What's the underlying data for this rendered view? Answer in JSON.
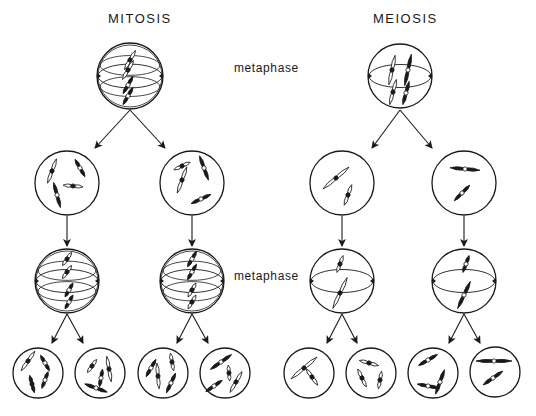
{
  "figure": {
    "background": "#ffffff",
    "ink": "#1a1a1a",
    "titles": {
      "mitosis": {
        "text": "MITOSIS",
        "x": 108,
        "y": 18
      },
      "meiosis": {
        "text": "MEIOSIS",
        "x": 373,
        "y": 18
      }
    },
    "phase_labels": [
      {
        "text": "metaphase",
        "x": 234,
        "y": 68
      },
      {
        "text": "metaphase",
        "x": 234,
        "y": 276
      }
    ],
    "cells": [
      {
        "id": "mitosis-parent",
        "cx": 130,
        "cy": 76,
        "r": 33,
        "spindle": true,
        "group": "mitosis",
        "stage": "metaphase"
      },
      {
        "id": "mitosis-daughter-a",
        "cx": 67,
        "cy": 183,
        "r": 32,
        "spindle": false,
        "group": "mitosis"
      },
      {
        "id": "mitosis-daughter-b",
        "cx": 192,
        "cy": 183,
        "r": 32,
        "spindle": false,
        "group": "mitosis"
      },
      {
        "id": "mitosis-daughter-a-metaphase",
        "cx": 67,
        "cy": 281,
        "r": 32,
        "spindle": true,
        "group": "mitosis",
        "stage": "metaphase"
      },
      {
        "id": "mitosis-daughter-b-metaphase",
        "cx": 192,
        "cy": 281,
        "r": 32,
        "spindle": true,
        "group": "mitosis",
        "stage": "metaphase"
      },
      {
        "id": "mitosis-grand-1",
        "cx": 38,
        "cy": 373,
        "r": 25,
        "spindle": false,
        "group": "mitosis"
      },
      {
        "id": "mitosis-grand-2",
        "cx": 100,
        "cy": 373,
        "r": 25,
        "spindle": false,
        "group": "mitosis"
      },
      {
        "id": "mitosis-grand-3",
        "cx": 163,
        "cy": 373,
        "r": 25,
        "spindle": false,
        "group": "mitosis"
      },
      {
        "id": "mitosis-grand-4",
        "cx": 225,
        "cy": 373,
        "r": 25,
        "spindle": false,
        "group": "mitosis"
      },
      {
        "id": "meiosis-parent",
        "cx": 400,
        "cy": 76,
        "r": 32,
        "spindle": true,
        "group": "meiosis",
        "stage": "metaphase"
      },
      {
        "id": "meiosis-daughter-a",
        "cx": 342,
        "cy": 183,
        "r": 32,
        "spindle": false,
        "group": "meiosis"
      },
      {
        "id": "meiosis-daughter-b",
        "cx": 464,
        "cy": 183,
        "r": 32,
        "spindle": false,
        "group": "meiosis"
      },
      {
        "id": "meiosis-daughter-a-metaphase",
        "cx": 342,
        "cy": 281,
        "r": 32,
        "spindle": true,
        "group": "meiosis",
        "stage": "metaphase"
      },
      {
        "id": "meiosis-daughter-b-metaphase",
        "cx": 464,
        "cy": 281,
        "r": 32,
        "spindle": true,
        "group": "meiosis",
        "stage": "metaphase"
      },
      {
        "id": "meiosis-grand-1",
        "cx": 309,
        "cy": 373,
        "r": 25,
        "spindle": false,
        "group": "meiosis"
      },
      {
        "id": "meiosis-grand-2",
        "cx": 371,
        "cy": 373,
        "r": 25,
        "spindle": false,
        "group": "meiosis"
      },
      {
        "id": "meiosis-grand-3",
        "cx": 433,
        "cy": 373,
        "r": 25,
        "spindle": false,
        "group": "meiosis"
      },
      {
        "id": "meiosis-grand-4",
        "cx": 495,
        "cy": 372,
        "r": 25,
        "spindle": false,
        "group": "meiosis"
      }
    ],
    "arrows": [
      {
        "from": [
          130,
          110
        ],
        "to": [
          95,
          148
        ]
      },
      {
        "from": [
          130,
          110
        ],
        "to": [
          165,
          148
        ]
      },
      {
        "from": [
          67,
          216
        ],
        "to": [
          67,
          246
        ]
      },
      {
        "from": [
          192,
          216
        ],
        "to": [
          192,
          246
        ]
      },
      {
        "from": [
          67,
          314
        ],
        "to": [
          52,
          343
        ]
      },
      {
        "from": [
          67,
          314
        ],
        "to": [
          83,
          343
        ]
      },
      {
        "from": [
          192,
          314
        ],
        "to": [
          177,
          343
        ]
      },
      {
        "from": [
          192,
          314
        ],
        "to": [
          208,
          343
        ]
      },
      {
        "from": [
          400,
          110
        ],
        "to": [
          372,
          148
        ]
      },
      {
        "from": [
          400,
          110
        ],
        "to": [
          432,
          148
        ]
      },
      {
        "from": [
          342,
          216
        ],
        "to": [
          342,
          246
        ]
      },
      {
        "from": [
          464,
          216
        ],
        "to": [
          464,
          246
        ]
      },
      {
        "from": [
          342,
          314
        ],
        "to": [
          327,
          343
        ]
      },
      {
        "from": [
          342,
          314
        ],
        "to": [
          357,
          343
        ]
      },
      {
        "from": [
          464,
          314
        ],
        "to": [
          449,
          343
        ]
      },
      {
        "from": [
          464,
          314
        ],
        "to": [
          480,
          343
        ]
      }
    ],
    "chromosomes": [
      {
        "cell": 0,
        "x": 130,
        "y": 60,
        "angle": -60,
        "len": 22,
        "fill": "open",
        "centromere": "filled"
      },
      {
        "cell": 0,
        "x": 128,
        "y": 70,
        "angle": -60,
        "len": 22,
        "fill": "open",
        "centromere": "filled"
      },
      {
        "cell": 0,
        "x": 128,
        "y": 85,
        "angle": -60,
        "len": 20,
        "fill": "solid",
        "centromere": "open"
      },
      {
        "cell": 0,
        "x": 128,
        "y": 96,
        "angle": -60,
        "len": 20,
        "fill": "solid",
        "centromere": "open"
      },
      {
        "cell": 1,
        "x": 52,
        "y": 171,
        "angle": -70,
        "len": 26,
        "fill": "open",
        "centromere": "filled"
      },
      {
        "cell": 1,
        "x": 80,
        "y": 168,
        "angle": 60,
        "len": 20,
        "fill": "solid",
        "centromere": "open"
      },
      {
        "cell": 1,
        "x": 73,
        "y": 186,
        "angle": 5,
        "len": 20,
        "fill": "open",
        "centromere": "filled"
      },
      {
        "cell": 1,
        "x": 57,
        "y": 195,
        "angle": 75,
        "len": 26,
        "fill": "solid",
        "centromere": "open"
      },
      {
        "cell": 2,
        "x": 182,
        "y": 166,
        "angle": -25,
        "len": 18,
        "fill": "open",
        "centromere": "filled"
      },
      {
        "cell": 2,
        "x": 182,
        "y": 180,
        "angle": -70,
        "len": 28,
        "fill": "open",
        "centromere": "filled"
      },
      {
        "cell": 2,
        "x": 204,
        "y": 168,
        "angle": 70,
        "len": 26,
        "fill": "solid",
        "centromere": "open"
      },
      {
        "cell": 2,
        "x": 201,
        "y": 199,
        "angle": -25,
        "len": 22,
        "fill": "solid",
        "centromere": "open"
      },
      {
        "cell": 3,
        "x": 67,
        "y": 259,
        "angle": -55,
        "len": 16,
        "fill": "open",
        "centromere": "filled"
      },
      {
        "cell": 3,
        "x": 67,
        "y": 272,
        "angle": -55,
        "len": 16,
        "fill": "open",
        "centromere": "filled"
      },
      {
        "cell": 3,
        "x": 69,
        "y": 290,
        "angle": -60,
        "len": 16,
        "fill": "solid",
        "centromere": "open"
      },
      {
        "cell": 3,
        "x": 69,
        "y": 302,
        "angle": -60,
        "len": 16,
        "fill": "solid",
        "centromere": "open"
      },
      {
        "cell": 4,
        "x": 192,
        "y": 259,
        "angle": -60,
        "len": 18,
        "fill": "solid",
        "centromere": "open"
      },
      {
        "cell": 4,
        "x": 192,
        "y": 272,
        "angle": -60,
        "len": 18,
        "fill": "solid",
        "centromere": "open"
      },
      {
        "cell": 4,
        "x": 192,
        "y": 290,
        "angle": -60,
        "len": 16,
        "fill": "open",
        "centromere": "filled"
      },
      {
        "cell": 4,
        "x": 192,
        "y": 302,
        "angle": -60,
        "len": 16,
        "fill": "open",
        "centromere": "filled"
      },
      {
        "cell": 9,
        "x": 392,
        "y": 70,
        "angle": -78,
        "len": 30,
        "fill": "open",
        "centromere": "filled"
      },
      {
        "cell": 9,
        "x": 408,
        "y": 70,
        "angle": -78,
        "len": 32,
        "fill": "solid",
        "centromere": "open"
      },
      {
        "cell": 9,
        "x": 393,
        "y": 92,
        "angle": -75,
        "len": 26,
        "fill": "open",
        "centromere": "filled"
      },
      {
        "cell": 9,
        "x": 406,
        "y": 93,
        "angle": -75,
        "len": 24,
        "fill": "solid",
        "centromere": "open"
      },
      {
        "cell": 10,
        "x": 336,
        "y": 178,
        "angle": -40,
        "len": 34,
        "fill": "open",
        "centromere": "filled"
      },
      {
        "cell": 10,
        "x": 348,
        "y": 195,
        "angle": -70,
        "len": 22,
        "fill": "open",
        "centromere": "filled"
      },
      {
        "cell": 11,
        "x": 465,
        "y": 169,
        "angle": 5,
        "len": 30,
        "fill": "solid",
        "centromere": "open"
      },
      {
        "cell": 11,
        "x": 462,
        "y": 193,
        "angle": -45,
        "len": 22,
        "fill": "solid",
        "centromere": "open"
      },
      {
        "cell": 12,
        "x": 340,
        "y": 264,
        "angle": -70,
        "len": 18,
        "fill": "open",
        "centromere": "filled"
      },
      {
        "cell": 12,
        "x": 340,
        "y": 293,
        "angle": -65,
        "len": 34,
        "fill": "open",
        "centromere": "filled"
      },
      {
        "cell": 13,
        "x": 466,
        "y": 264,
        "angle": -70,
        "len": 18,
        "fill": "solid",
        "centromere": "open"
      },
      {
        "cell": 13,
        "x": 464,
        "y": 295,
        "angle": -65,
        "len": 30,
        "fill": "solid",
        "centromere": "open"
      },
      {
        "cell": 5,
        "x": 28,
        "y": 361,
        "angle": -55,
        "len": 24,
        "fill": "open",
        "centromere": "filled"
      },
      {
        "cell": 5,
        "x": 45,
        "y": 363,
        "angle": 60,
        "len": 18,
        "fill": "solid",
        "centromere": "open"
      },
      {
        "cell": 5,
        "x": 32,
        "y": 384,
        "angle": 75,
        "len": 18,
        "fill": "solid",
        "centromere": "filled"
      },
      {
        "cell": 5,
        "x": 45,
        "y": 380,
        "angle": -70,
        "len": 18,
        "fill": "solid",
        "centromere": "open"
      },
      {
        "cell": 6,
        "x": 92,
        "y": 366,
        "angle": -55,
        "len": 16,
        "fill": "open",
        "centromere": "filled"
      },
      {
        "cell": 6,
        "x": 109,
        "y": 369,
        "angle": 80,
        "len": 26,
        "fill": "open",
        "centromere": "filled"
      },
      {
        "cell": 6,
        "x": 101,
        "y": 378,
        "angle": -80,
        "len": 18,
        "fill": "solid",
        "centromere": "open"
      },
      {
        "cell": 6,
        "x": 96,
        "y": 388,
        "angle": 20,
        "len": 24,
        "fill": "solid",
        "centromere": "open"
      },
      {
        "cell": 7,
        "x": 151,
        "y": 368,
        "angle": -60,
        "len": 20,
        "fill": "solid",
        "centromere": "open"
      },
      {
        "cell": 7,
        "x": 158,
        "y": 376,
        "angle": 85,
        "len": 26,
        "fill": "open",
        "centromere": "filled"
      },
      {
        "cell": 7,
        "x": 172,
        "y": 362,
        "angle": 80,
        "len": 18,
        "fill": "open",
        "centromere": "filled"
      },
      {
        "cell": 7,
        "x": 171,
        "y": 383,
        "angle": -65,
        "len": 22,
        "fill": "solid",
        "centromere": "open"
      },
      {
        "cell": 8,
        "x": 221,
        "y": 362,
        "angle": -35,
        "len": 26,
        "fill": "solid",
        "centromere": "open"
      },
      {
        "cell": 8,
        "x": 229,
        "y": 373,
        "angle": 85,
        "len": 16,
        "fill": "open",
        "centromere": "filled"
      },
      {
        "cell": 8,
        "x": 214,
        "y": 386,
        "angle": -35,
        "len": 20,
        "fill": "solid",
        "centromere": "open"
      },
      {
        "cell": 8,
        "x": 236,
        "y": 382,
        "angle": -60,
        "len": 24,
        "fill": "open",
        "centromere": "filled"
      },
      {
        "cell": 14,
        "x": 304,
        "y": 368,
        "angle": -40,
        "len": 34,
        "fill": "open",
        "centromere": "filled"
      },
      {
        "cell": 14,
        "x": 312,
        "y": 377,
        "angle": 55,
        "len": 20,
        "fill": "open",
        "centromere": "filled"
      },
      {
        "cell": 15,
        "x": 369,
        "y": 363,
        "angle": 15,
        "len": 20,
        "fill": "open",
        "centromere": "filled"
      },
      {
        "cell": 15,
        "x": 362,
        "y": 378,
        "angle": 65,
        "len": 20,
        "fill": "open",
        "centromere": "filled"
      },
      {
        "cell": 15,
        "x": 380,
        "y": 380,
        "angle": -80,
        "len": 18,
        "fill": "open",
        "centromere": "filled"
      },
      {
        "cell": 16,
        "x": 428,
        "y": 360,
        "angle": -30,
        "len": 22,
        "fill": "solid",
        "centromere": "open"
      },
      {
        "cell": 16,
        "x": 440,
        "y": 382,
        "angle": -70,
        "len": 26,
        "fill": "solid",
        "centromere": "open"
      },
      {
        "cell": 16,
        "x": 428,
        "y": 386,
        "angle": 10,
        "len": 22,
        "fill": "solid",
        "centromere": "open"
      },
      {
        "cell": 17,
        "x": 494,
        "y": 361,
        "angle": 0,
        "len": 36,
        "fill": "solid",
        "centromere": "open"
      },
      {
        "cell": 17,
        "x": 493,
        "y": 378,
        "angle": -35,
        "len": 24,
        "fill": "solid",
        "centromere": "open"
      }
    ]
  }
}
